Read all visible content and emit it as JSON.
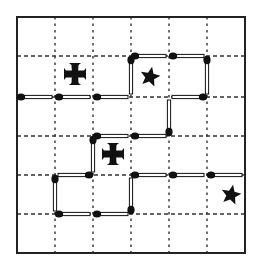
{
  "puzzle": {
    "title": "Matchstick grid puzzle",
    "grid": {
      "cols": 6,
      "rows": 6,
      "x_lines": [
        17,
        55,
        93,
        131,
        169,
        207,
        245
      ],
      "y_lines": [
        17,
        56,
        97,
        136,
        175,
        214,
        253
      ],
      "border_color": "#222222",
      "dash_color": "#333333"
    },
    "matches": [
      {
        "from": [
          0,
          2
        ],
        "to": [
          1,
          2
        ],
        "head": "from"
      },
      {
        "from": [
          1,
          2
        ],
        "to": [
          2,
          2
        ],
        "head": "from"
      },
      {
        "from": [
          2,
          2
        ],
        "to": [
          3,
          2
        ],
        "head": "from"
      },
      {
        "from": [
          3,
          2
        ],
        "to": [
          3,
          1
        ],
        "head": "to"
      },
      {
        "from": [
          3,
          1
        ],
        "to": [
          4,
          1
        ],
        "head": "from"
      },
      {
        "from": [
          4,
          1
        ],
        "to": [
          5,
          1
        ],
        "head": "from"
      },
      {
        "from": [
          5,
          1
        ],
        "to": [
          5,
          2
        ],
        "head": "from"
      },
      {
        "from": [
          5,
          2
        ],
        "to": [
          4,
          2
        ],
        "head": "from"
      },
      {
        "from": [
          4,
          2
        ],
        "to": [
          4,
          3
        ],
        "head": "to"
      },
      {
        "from": [
          4,
          3
        ],
        "to": [
          3,
          3
        ],
        "head": "to"
      },
      {
        "from": [
          3,
          3
        ],
        "to": [
          2,
          3
        ],
        "head": "to"
      },
      {
        "from": [
          2,
          3
        ],
        "to": [
          2,
          4
        ],
        "head": "from"
      },
      {
        "from": [
          2,
          4
        ],
        "to": [
          1,
          4
        ],
        "head": "from"
      },
      {
        "from": [
          1,
          4
        ],
        "to": [
          1,
          5
        ],
        "head": "from"
      },
      {
        "from": [
          1,
          5
        ],
        "to": [
          2,
          5
        ],
        "head": "from"
      },
      {
        "from": [
          2,
          5
        ],
        "to": [
          3,
          5
        ],
        "head": "from"
      },
      {
        "from": [
          3,
          5
        ],
        "to": [
          3,
          4
        ],
        "head": "from"
      },
      {
        "from": [
          3,
          4
        ],
        "to": [
          4,
          4
        ],
        "head": "from"
      },
      {
        "from": [
          4,
          4
        ],
        "to": [
          5,
          4
        ],
        "head": "from"
      },
      {
        "from": [
          5,
          4
        ],
        "to": [
          6,
          4
        ],
        "head": "from"
      }
    ],
    "symbols": [
      {
        "type": "cross",
        "cx": 75,
        "cy": 74,
        "size": 22
      },
      {
        "type": "star",
        "cx": 150,
        "cy": 77,
        "size": 21
      },
      {
        "type": "cross",
        "cx": 113,
        "cy": 154,
        "size": 22
      },
      {
        "type": "star",
        "cx": 231,
        "cy": 195,
        "size": 21
      }
    ],
    "match_color": "#111111",
    "fill_color": "#ffffff"
  }
}
